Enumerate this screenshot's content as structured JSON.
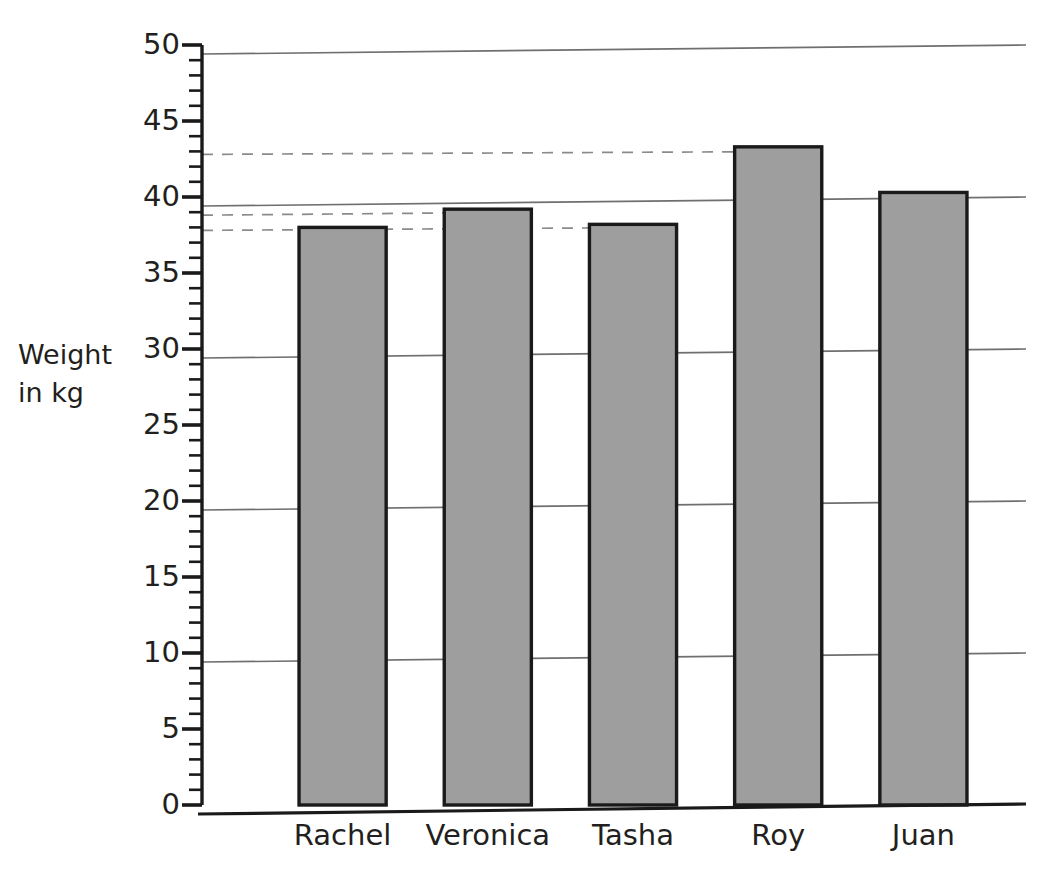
{
  "chart_data": {
    "type": "bar",
    "title": "",
    "categories": [
      "Rachel",
      "Veronica",
      "Tasha",
      "Roy",
      "Juan"
    ],
    "values": [
      38,
      39.2,
      38.2,
      43.3,
      40.3
    ],
    "xlabel": "",
    "ylabel": "Weight in kg",
    "ylim": [
      0,
      50
    ],
    "ytick_step": 5,
    "yminor_step": 1,
    "ytick_labels": [
      "50",
      "45",
      "40",
      "35",
      "30",
      "25",
      "20",
      "15",
      "10",
      "5",
      "0"
    ],
    "ytick_values": [
      50,
      45,
      40,
      35,
      30,
      25,
      20,
      15,
      10,
      5,
      0
    ],
    "gridlines_major_at": [
      10,
      20,
      30,
      40,
      50
    ],
    "grid": true,
    "legend": "none",
    "annotations": [
      {
        "type": "dashed-guide",
        "value": 43,
        "to_category": "Roy"
      },
      {
        "type": "dashed-guide",
        "value": 39,
        "to_category": "Veronica"
      },
      {
        "type": "dashed-guide",
        "value": 38,
        "to_category": "Tasha"
      }
    ],
    "bar_fill_color": "#9e9e9e",
    "bar_border_color": "#1a1a1a",
    "grid_color": "#6f6f6f",
    "axis_color": "#1a1a1a"
  },
  "axis": {
    "y_label_line1": "Weight",
    "y_label_line2": "in kg"
  }
}
